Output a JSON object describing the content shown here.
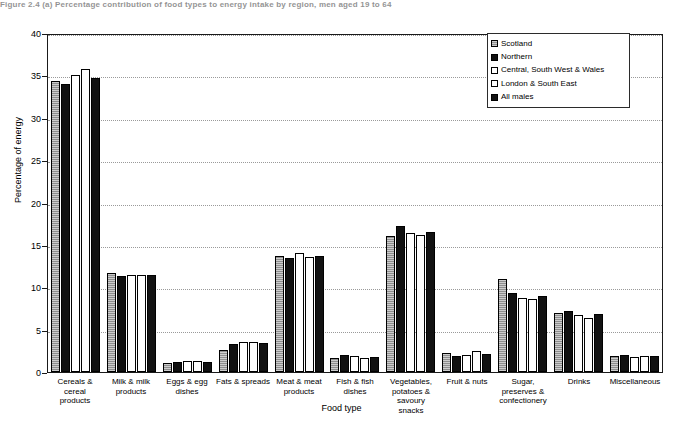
{
  "figure": {
    "caption": "Figure 2.4 (a)   Percentage contribution of food types to energy intake by region, men aged 19 to 64"
  },
  "chart_data": {
    "type": "bar",
    "title": "",
    "xlabel": "Food type",
    "ylabel": "Percentage of energy",
    "ylim": [
      0,
      40
    ],
    "yticks": [
      0,
      5,
      10,
      15,
      20,
      25,
      30,
      35,
      40
    ],
    "grid": true,
    "legend_position": "top-right",
    "categories": [
      "Cereals &\ncereal products",
      "Milk & milk\nproducts",
      "Eggs & egg\ndishes",
      "Fats & spreads",
      "Meat & meat\nproducts",
      "Fish & fish\ndishes",
      "Vegetables,\npotatoes &\nsavoury snacks",
      "Fruit & nuts",
      "Sugar,\npreserves &\nconfectionery",
      "Drinks",
      "Miscellaneous"
    ],
    "series": [
      {
        "name": "Scotland",
        "fill": "grey-hatched",
        "color": "#8e8e8e",
        "values": [
          34.3,
          11.7,
          1.1,
          2.6,
          13.7,
          1.7,
          16.0,
          2.2,
          11.0,
          7.0,
          1.9
        ]
      },
      {
        "name": "Northern",
        "fill": "solid-black",
        "color": "#101010",
        "values": [
          34.0,
          11.3,
          1.2,
          3.3,
          13.5,
          2.0,
          17.2,
          1.9,
          9.3,
          7.2,
          2.0
        ]
      },
      {
        "name": "Central, South West & Wales",
        "fill": "white",
        "color": "#ffffff",
        "values": [
          35.0,
          11.5,
          1.3,
          3.5,
          14.1,
          1.9,
          16.4,
          2.0,
          8.7,
          6.7,
          1.8
        ]
      },
      {
        "name": "London & South East",
        "fill": "white",
        "color": "#ffffff",
        "values": [
          35.7,
          11.4,
          1.3,
          3.5,
          13.6,
          1.6,
          16.2,
          2.5,
          8.6,
          6.4,
          1.9
        ]
      },
      {
        "name": "All males",
        "fill": "solid-black",
        "color": "#121212",
        "values": [
          34.7,
          11.5,
          1.2,
          3.4,
          13.7,
          1.8,
          16.5,
          2.1,
          9.0,
          6.8,
          1.9
        ]
      }
    ]
  }
}
